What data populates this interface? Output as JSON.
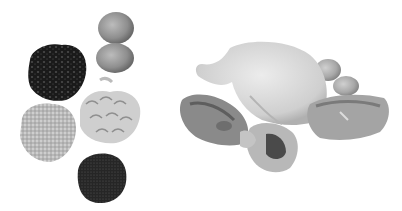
{
  "image": {
    "description": "Grayscale photograph of protein-rich foods on a white background",
    "background": "#ffffff",
    "items": [
      {
        "name": "black-beans",
        "label": "Black beans"
      },
      {
        "name": "eggs",
        "label": "Two eggs"
      },
      {
        "name": "cashews",
        "label": "Cashew nuts"
      },
      {
        "name": "grains",
        "label": "Grains / oats"
      },
      {
        "name": "seeds",
        "label": "Dark seeds"
      },
      {
        "name": "whole-chicken",
        "label": "Whole chicken"
      },
      {
        "name": "eggs-behind-chicken",
        "label": "Eggs"
      },
      {
        "name": "steak",
        "label": "Meat steak"
      },
      {
        "name": "fish-steak",
        "label": "Fish steak"
      },
      {
        "name": "shellfish",
        "label": "Shellfish"
      }
    ]
  }
}
